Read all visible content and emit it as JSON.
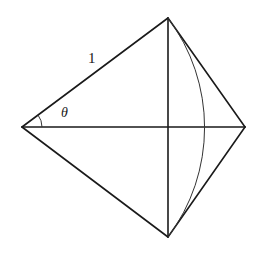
{
  "figure": {
    "type": "geometric-construction",
    "vertices": {
      "left": [
        22,
        127
      ],
      "top": [
        168,
        18
      ],
      "right": [
        245,
        127
      ],
      "bottom": [
        168,
        237
      ]
    },
    "arc": {
      "center": "left",
      "radius_ref": "left-top",
      "crosses_horizontal_at": [
        204,
        127
      ]
    },
    "labels": {
      "side_length": "1",
      "angle": "θ"
    },
    "colors": {
      "stroke": "#1a1a1a",
      "background": "#ffffff"
    }
  }
}
